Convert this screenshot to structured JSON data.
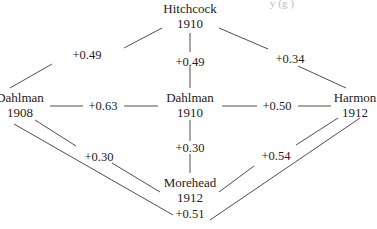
{
  "header_fragment": "y   (g   )",
  "nodes": [
    {
      "id": "hitchcock-1910",
      "name": "Hitchcock",
      "year": "1910",
      "x": 190,
      "y": 9
    },
    {
      "id": "dahlman-1908",
      "name": "Dahlman",
      "year": "1908",
      "x": 19,
      "y": 98
    },
    {
      "id": "dahlman-1910",
      "name": "Dahlman",
      "year": "1910",
      "x": 190,
      "y": 98
    },
    {
      "id": "harmon-1912",
      "name": "Harmon",
      "year": "1912",
      "x": 355,
      "y": 98
    },
    {
      "id": "morehead-1912",
      "name": "Morehead",
      "year": "1912",
      "x": 190,
      "y": 183
    }
  ],
  "edges": [
    {
      "from": "dahlman-1908",
      "to": "hitchcock-1910",
      "label": "+0.49",
      "lx": 87,
      "ly": 55,
      "segments": [
        [
          10,
          88,
          52,
          64
        ],
        [
          124,
          48,
          162,
          28
        ]
      ]
    },
    {
      "from": "hitchcock-1910",
      "to": "dahlman-1910",
      "label": "+0.49",
      "lx": 190,
      "ly": 62,
      "segments": [
        [
          190,
          33,
          190,
          52
        ],
        [
          190,
          66,
          190,
          88
        ]
      ]
    },
    {
      "from": "hitchcock-1910",
      "to": "harmon-1912",
      "label": "+0.34",
      "lx": 290,
      "ly": 59,
      "segments": [
        [
          219,
          28,
          268,
          49
        ],
        [
          298,
          66,
          346,
          88
        ]
      ]
    },
    {
      "from": "dahlman-1908",
      "to": "dahlman-1910",
      "label": "+0.63",
      "lx": 103,
      "ly": 106,
      "segments": [
        [
          50,
          106,
          83,
          106
        ],
        [
          124,
          106,
          158,
          106
        ]
      ]
    },
    {
      "from": "dahlman-1910",
      "to": "harmon-1912",
      "label": "+0.50",
      "lx": 277,
      "ly": 106,
      "segments": [
        [
          222,
          106,
          257,
          106
        ],
        [
          298,
          106,
          331,
          106
        ]
      ]
    },
    {
      "from": "dahlman-1910",
      "to": "morehead-1912",
      "label": "+0.30",
      "lx": 190,
      "ly": 148,
      "segments": [
        [
          190,
          120,
          190,
          141
        ],
        [
          190,
          154,
          190,
          173
        ]
      ]
    },
    {
      "from": "dahlman-1908",
      "to": "morehead-1912",
      "label": "+0.30",
      "lx": 99,
      "ly": 157,
      "segments": [
        [
          35,
          120,
          76,
          146
        ],
        [
          112,
          163,
          160,
          192
        ]
      ]
    },
    {
      "from": "harmon-1912",
      "to": "morehead-1912",
      "label": "+0.54",
      "lx": 276,
      "ly": 156,
      "segments": [
        [
          338,
          118,
          296,
          145
        ],
        [
          254,
          166,
          219,
          192
        ]
      ]
    },
    {
      "from": "dahlman-1908",
      "to": "morehead-1912",
      "via": "long",
      "label": "+0.51",
      "lx": 190,
      "ly": 214,
      "segments": [
        [
          14,
          124,
          173,
          215
        ],
        [
          210,
          220,
          360,
          118
        ]
      ]
    }
  ]
}
